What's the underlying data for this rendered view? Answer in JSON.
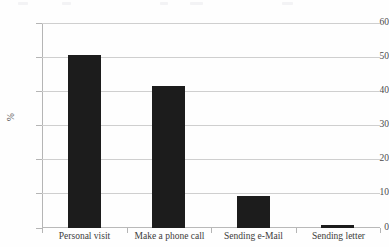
{
  "chart_data": {
    "type": "bar",
    "title": "",
    "subtitle": "",
    "xlabel": "",
    "ylabel": "%",
    "categories": [
      "Personal visit",
      "Make a phone call",
      "Sending e-Mail",
      "Sending letter"
    ],
    "values": [
      50.7,
      41.7,
      9.4,
      0.8
    ],
    "series": [
      {
        "name": "",
        "values": [
          50.7,
          41.7,
          9.4,
          0.8
        ]
      }
    ],
    "ylim": [
      0,
      60
    ],
    "ytick_labels": [
      "0",
      "10",
      "20",
      "30",
      "40",
      "50",
      "60"
    ],
    "ytick_values": [
      0,
      10,
      20,
      30,
      40,
      50,
      60
    ],
    "grid": "horizontal",
    "legend": "none",
    "bar_color": "#1c1c1c",
    "gridline_color": "#cfcfcf",
    "axis_color": "#b5b5b5",
    "text_color": "#3c3c3c"
  }
}
